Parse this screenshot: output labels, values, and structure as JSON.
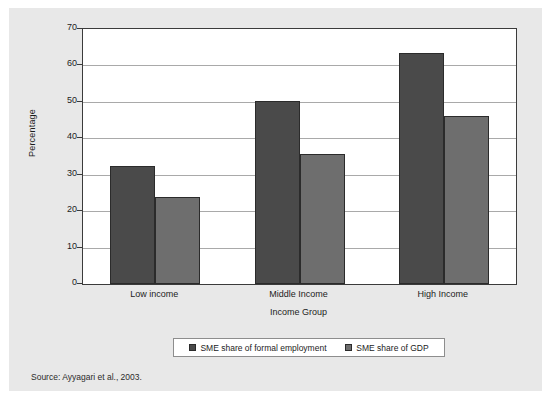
{
  "figure": {
    "source_note": "Source: Ayyagari et al., 2003.",
    "panel_background": "#e8e8e8"
  },
  "chart_data": {
    "type": "bar",
    "title": "",
    "xlabel": "Income Group",
    "ylabel": "Percentage",
    "ylim": [
      0,
      70
    ],
    "yticks": [
      0,
      10,
      20,
      30,
      40,
      50,
      60,
      70
    ],
    "ytick_labels": [
      "0",
      "10",
      "20",
      "30",
      "40",
      "50",
      "60",
      "70"
    ],
    "grid": true,
    "legend_position": "bottom",
    "categories": [
      "Low income",
      "Middle Income",
      "High Income"
    ],
    "series": [
      {
        "name": "SME share of formal employment",
        "color": "#4a4a4a",
        "values": [
          32.4,
          50.3,
          63.5
        ]
      },
      {
        "name": "SME share of GDP",
        "color": "#6e6e6e",
        "values": [
          23.8,
          35.7,
          46.0
        ]
      }
    ]
  }
}
